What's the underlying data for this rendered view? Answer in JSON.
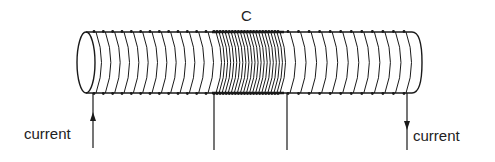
{
  "diagram": {
    "type": "solenoid-coil",
    "labels": {
      "coil_section": "C",
      "current_in": "current",
      "current_out": "current"
    },
    "colors": {
      "stroke": "#1a1a1a",
      "background": "#ffffff",
      "text": "#222222"
    },
    "geometry": {
      "tube_left_x": 86,
      "tube_right_x": 418,
      "tube_top_y": 32,
      "tube_bottom_y": 93,
      "sparse_left_turns": 13,
      "dense_turns": 22,
      "sparse_right_turns": 12,
      "dense_start_x": 212,
      "dense_end_x": 280,
      "wire_in_x": 93,
      "wire_out_x": 407,
      "probe_left_x": 214,
      "probe_right_x": 287
    }
  }
}
